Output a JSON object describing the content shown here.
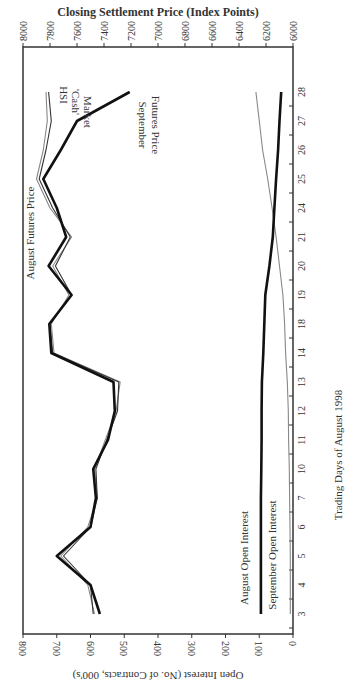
{
  "chart_data": {
    "type": "line",
    "orientation": "rotated 90 degrees clockwise (x-axis runs top-to-bottom on page, reversed)",
    "title_top_axis": "Closing Settlement Price (Index Points)",
    "xlabel": "Trading Days of August 1998",
    "ylabel_left": "Closing Settlement Price (Index Points)",
    "ylabel_right": "Open Interest (No. of Contracts, 000's)",
    "categories": [
      "3",
      "4",
      "5",
      "6",
      "7",
      "10",
      "11",
      "12",
      "13",
      "14",
      "18",
      "19",
      "20",
      "21",
      "24",
      "25",
      "26",
      "27",
      "28"
    ],
    "price_axis": {
      "range": [
        6000,
        8000
      ],
      "ticks": [
        8000,
        7800,
        7600,
        7400,
        7200,
        7000,
        6800,
        6600,
        6400,
        6200,
        6000
      ]
    },
    "open_interest_axis": {
      "range": [
        0,
        800
      ],
      "ticks": [
        800,
        700,
        600,
        500,
        400,
        300,
        200,
        100,
        0
      ]
    },
    "series": [
      {
        "name": "September Futures Price",
        "axis": "price",
        "style": "thick black",
        "values": [
          7430,
          7500,
          7750,
          7500,
          7460,
          7480,
          7370,
          7320,
          7330,
          7790,
          7805,
          7640,
          7810,
          7680,
          7750,
          7850,
          7720,
          7600,
          7210
        ]
      },
      {
        "name": "August Futures Price",
        "axis": "price",
        "style": "thin dark",
        "values": [
          7480,
          7500,
          7700,
          7500,
          7450,
          7460,
          7380,
          7300,
          7290,
          7780,
          7800,
          7640,
          7760,
          7650,
          7780,
          7880,
          7830,
          7790,
          7810
        ]
      },
      {
        "name": "HSI 'Cash' Market",
        "axis": "price",
        "style": "thin gray",
        "values": [
          7470,
          7520,
          7720,
          7520,
          7450,
          7470,
          7390,
          7310,
          7280,
          7770,
          7790,
          7660,
          7780,
          7640,
          7800,
          7900,
          7850,
          7820,
          7830
        ]
      },
      {
        "name": "August Open Interest",
        "axis": "open_interest",
        "style": "thick black",
        "values": [
          95,
          95,
          95,
          95,
          95,
          94,
          93,
          93,
          92,
          88,
          85,
          82,
          70,
          60,
          55,
          50,
          44,
          40,
          35
        ]
      },
      {
        "name": "September Open Interest",
        "axis": "open_interest",
        "style": "thin gray",
        "values": [
          8,
          8,
          8,
          9,
          10,
          11,
          13,
          14,
          17,
          22,
          25,
          30,
          40,
          50,
          62,
          75,
          90,
          100,
          110
        ]
      }
    ],
    "annotations": [
      "August Futures Price",
      "HSI 'Cash' Market",
      "September Futures Price",
      "August Open Interest",
      "September Open Interest"
    ],
    "grid": false,
    "legend": "inline labels"
  },
  "labels": {
    "top_axis_title": "Closing Settlement Price (Index Points)",
    "bottom_axis_title": "Open Interest (No. of Contracts, 000's)",
    "day_axis_title": "Trading Days of August 1998",
    "aug_futures": "August Futures Price",
    "hsi_1": "HSI",
    "hsi_2": "'Cash'",
    "hsi_3": "Market",
    "sep_futures_1": "September",
    "sep_futures_2": "Futures Price",
    "aug_oi": "August Open Interest",
    "sep_oi": "September Open Interest"
  }
}
